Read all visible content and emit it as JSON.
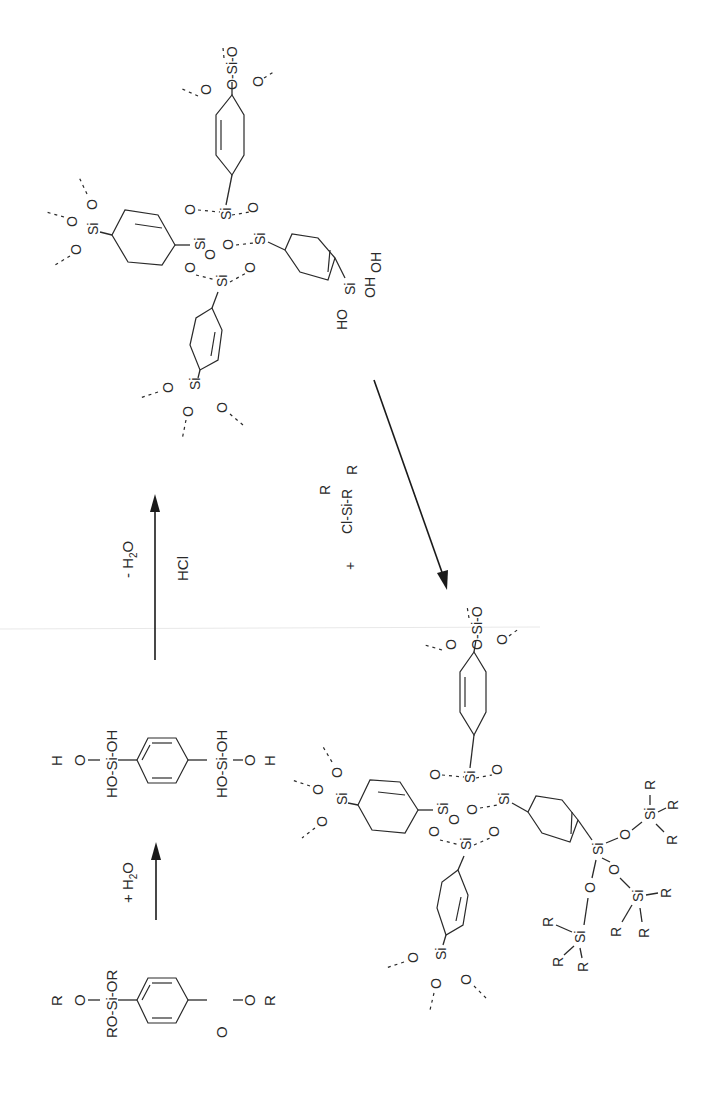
{
  "figure": {
    "type": "reaction-scheme",
    "orientation": "rotated-90-ccw",
    "colors": {
      "ink": "#2a2a2a",
      "background": "#ffffff"
    }
  },
  "molecules": {
    "alkoxysilane_monomer": {
      "name": "1,4-bis(trialkoxysilyl)benzene",
      "left_silyl": {
        "top": "R",
        "o_top": "O",
        "si": "RO-Si-OR"
      },
      "right_silyl": {
        "si": "RO-Si-",
        "o_bottom": "O",
        "r_bottom": "R",
        "or": "OR"
      },
      "labels": [
        "RO-Si-OR",
        "R",
        "O",
        "RO-Si-",
        "OR",
        "O",
        "R"
      ]
    },
    "silanol_monomer": {
      "name": "1,4-bis(trihydroxysilyl)benzene",
      "labels": [
        "HO-Si-OH",
        "H",
        "O",
        "HO-Si-OH",
        "O",
        "H"
      ]
    },
    "network_silanol": {
      "name": "arylene-bridged polysilsesquioxane network with free silanol",
      "cage_labels": [
        "Si",
        "O",
        "Si",
        "O",
        "Si",
        "O",
        "Si",
        "O",
        "O",
        "O"
      ],
      "terminal_group": "Si(OH)3",
      "terminal_labels": [
        "HO",
        "Si",
        "OH",
        "OH"
      ],
      "network_ends": "O-Si-O"
    },
    "network_capped": {
      "name": "end-capped (trialkylsilylated) network",
      "cage_labels": [
        "Si",
        "O",
        "Si",
        "O",
        "Si",
        "O",
        "Si",
        "O",
        "O",
        "O"
      ],
      "capped_group": "Si(OSiR3)3",
      "cap_labels": [
        "Si",
        "O",
        "R",
        "R",
        "R"
      ]
    }
  },
  "reactions": [
    {
      "id": "hydrolysis",
      "reagent_above": "+ H",
      "reagent_sub": "2",
      "reagent_tail": "O",
      "reagent_below": ""
    },
    {
      "id": "condensation",
      "reagent_above": "- H",
      "reagent_sub": "2",
      "reagent_tail": "O",
      "reagent_below": "HCl"
    },
    {
      "id": "silylation",
      "reagent_plus": "+",
      "reagent_main": "Cl-Si-R",
      "reagent_r_top": "R",
      "reagent_r_bottom": "R"
    }
  ],
  "atoms": {
    "Si": "Si",
    "O": "O",
    "R": "R",
    "H": "H",
    "HO": "HO",
    "OH": "OH",
    "RO": "RO",
    "OR": "OR"
  }
}
